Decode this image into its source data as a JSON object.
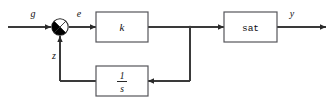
{
  "diagram": {
    "type": "control-system-block-diagram",
    "signals": {
      "input_label": "g",
      "error_label": "e",
      "feedback_label": "z",
      "output_label": "y"
    },
    "blocks": [
      {
        "id": "gain",
        "label": "k",
        "style": "math-italic"
      },
      {
        "id": "saturation",
        "label": "sat",
        "style": "monospace"
      },
      {
        "id": "integrator",
        "numerator": "1",
        "denominator": "s",
        "style": "fraction"
      }
    ],
    "junction": {
      "id": "summing-junction",
      "shape": "circle-quadrants",
      "inputs": [
        "g",
        "z"
      ],
      "output": "e"
    },
    "colors": {
      "wire": "#3a3a3a",
      "block_border": "#55555a",
      "block_fill": "#ffffff",
      "text": "#111111",
      "background": "#ffffff"
    }
  }
}
